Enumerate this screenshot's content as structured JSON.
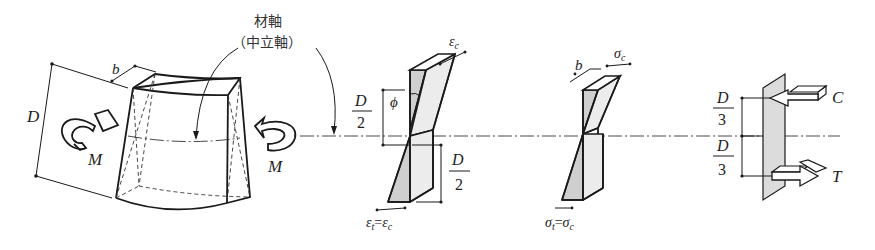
{
  "figure": {
    "beam": {
      "axis_label_line1": "材軸",
      "axis_label_line2": "（中立軸）",
      "depth_label": "D",
      "width_label": "b",
      "moment_left_label": "M",
      "moment_right_label": "M"
    },
    "strain_diagram": {
      "top_label": "ε",
      "top_sub": "c",
      "half_depth_num_top": "D",
      "half_depth_den_top": "2",
      "half_depth_num_bottom": "D",
      "half_depth_den_bottom": "2",
      "angle_label": "ϕ",
      "bottom_lhs": "ε",
      "bottom_lhs_sub": "t",
      "bottom_eq": "=",
      "bottom_rhs": "ε",
      "bottom_rhs_sub": "c"
    },
    "stress_diagram": {
      "width_label": "b",
      "top_label": "σ",
      "top_sub": "c",
      "bottom_lhs": "σ",
      "bottom_lhs_sub": "t",
      "bottom_eq": "=",
      "bottom_rhs": "σ",
      "bottom_rhs_sub": "c"
    },
    "force_diagram": {
      "upper_num": "D",
      "upper_den": "3",
      "lower_num": "D",
      "lower_den": "3",
      "compression_label": "C",
      "tension_label": "T"
    },
    "colors": {
      "line": "#1a1a1a",
      "shade_dark": "#cfcfcf",
      "shade_light": "#ececec",
      "background": "#ffffff"
    }
  }
}
